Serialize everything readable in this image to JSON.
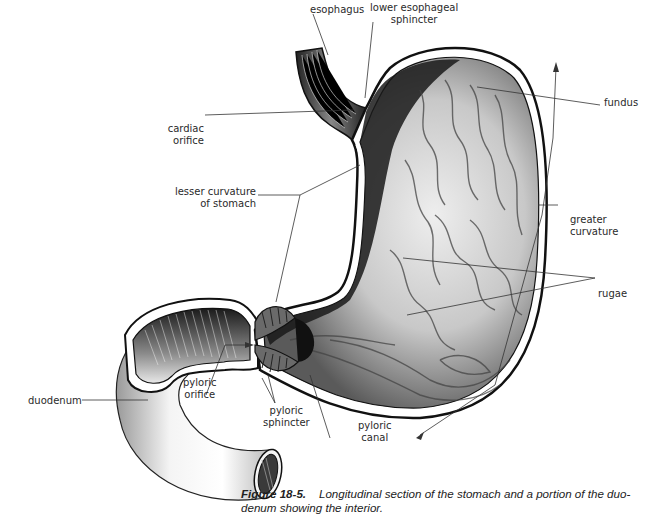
{
  "figure": {
    "number": "Figure 18-5.",
    "caption": "Longitudinal section of the stomach and a portion of the duodenum showing the interior.",
    "caption_line1": "Longitudinal section of the stomach and a portion of the duo-",
    "caption_line2": "denum showing the interior."
  },
  "labels": {
    "esophagus": "esophagus",
    "lower_esophageal_sphincter_1": "lower esophageal",
    "lower_esophageal_sphincter_2": "sphincter",
    "fundus": "fundus",
    "cardiac_orifice_1": "cardiac",
    "cardiac_orifice_2": "orifice",
    "lesser_curvature_1": "lesser curvature",
    "lesser_curvature_2": "of stomach",
    "greater_curvature_1": "greater",
    "greater_curvature_2": "curvature",
    "rugae": "rugae",
    "duodenum": "duodenum",
    "pyloric_orifice_1": "pyloric",
    "pyloric_orifice_2": "orifice",
    "pyloric_sphincter_1": "pyloric",
    "pyloric_sphincter_2": "sphincter",
    "pyloric_canal_1": "pyloric",
    "pyloric_canal_2": "canal"
  },
  "colors": {
    "background": "#ffffff",
    "ink": "#111111",
    "leader_line": "#333333"
  }
}
